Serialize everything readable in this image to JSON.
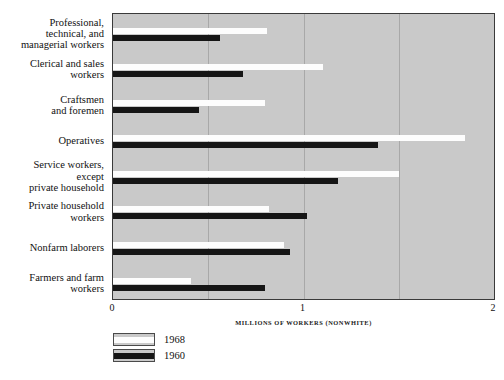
{
  "chart_data": {
    "type": "bar",
    "orientation": "horizontal",
    "title": "",
    "xlabel": "MILLIONS OF WORKERS (NONWHITE)",
    "ylabel": "",
    "xlim": [
      0,
      2
    ],
    "xticks": [
      "0",
      "1",
      "2"
    ],
    "xtick_values": [
      0,
      1,
      2
    ],
    "gridlines": [
      0.5,
      1.0,
      1.5
    ],
    "grid": true,
    "legend_position": "below-left",
    "categories": [
      "Professional, technical, and managerial workers",
      "Clerical and sales workers",
      "Craftsmen and foremen",
      "Operatives",
      "Service workers, except private household",
      "Private household workers",
      "Nonfarm laborers",
      "Farmers and farm workers"
    ],
    "category_lines": [
      [
        "Professional,",
        "technical, and",
        "managerial workers"
      ],
      [
        "Clerical and sales",
        "workers"
      ],
      [
        "Craftsmen",
        "and foremen"
      ],
      [
        "Operatives"
      ],
      [
        "Service workers,",
        "except",
        "private household"
      ],
      [
        "Private household",
        "workers"
      ],
      [
        "Nonfarm laborers"
      ],
      [
        "Farmers and farm",
        "workers"
      ]
    ],
    "series": [
      {
        "name": "1968",
        "color": "#fdfdfd",
        "values": [
          0.81,
          1.1,
          0.8,
          1.85,
          1.5,
          0.82,
          0.9,
          0.41
        ]
      },
      {
        "name": "1960",
        "color": "#151515",
        "values": [
          0.56,
          0.68,
          0.45,
          1.39,
          1.18,
          1.02,
          0.93,
          0.8
        ]
      }
    ],
    "plot_background": "#c9c9c9"
  },
  "legend": {
    "items": [
      {
        "label": "1968",
        "color": "#fdfdfd"
      },
      {
        "label": "1960",
        "color": "#151515"
      }
    ]
  },
  "axis": {
    "x_title": "MILLIONS OF WORKERS (NONWHITE)",
    "ticks": [
      "0",
      "1",
      "2"
    ]
  }
}
